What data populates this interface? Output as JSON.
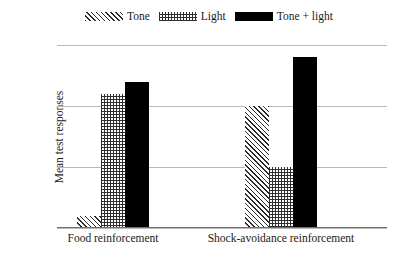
{
  "chart_data": {
    "type": "bar",
    "title": "",
    "xlabel": "",
    "ylabel": "Mean test responses",
    "ylim": [
      0,
      15
    ],
    "yticks": [
      0,
      5,
      10,
      15
    ],
    "grid": true,
    "legend_position": "top",
    "categories": [
      "Food reinforcement",
      "Shock-avoidance reinforcement"
    ],
    "series": [
      {
        "name": "Tone",
        "pattern": "diagonal-hatch",
        "color": "#2b2b2b",
        "values": [
          1,
          10
        ]
      },
      {
        "name": "Light",
        "pattern": "dotted",
        "color": "#2f2f2f",
        "values": [
          11,
          5
        ]
      },
      {
        "name": "Tone + light",
        "pattern": "solid",
        "color": "#000000",
        "values": [
          12,
          14
        ]
      }
    ]
  },
  "legend": {
    "items": [
      {
        "label": "Tone"
      },
      {
        "label": "Light"
      },
      {
        "label": "Tone + light"
      }
    ]
  },
  "axis": {
    "y": {
      "label": "Mean test responses",
      "ticks": [
        "15",
        "10",
        "5",
        "0"
      ]
    },
    "x": {
      "ticks": [
        "Food reinforcement",
        "Shock-avoidance reinforcement"
      ]
    }
  }
}
